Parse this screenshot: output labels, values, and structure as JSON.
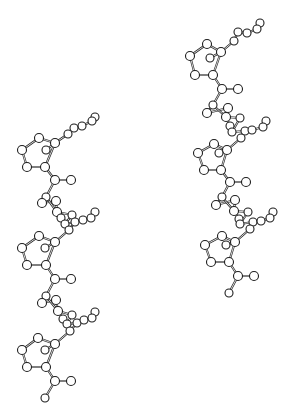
{
  "figure": {
    "width": 292,
    "height": 417,
    "background": "#ffffff",
    "ink_color": "#1e1e1e"
  },
  "molecules": [
    {
      "name": "left-chain",
      "atoms": [
        {
          "id": "L1",
          "x": 95,
          "y": 117,
          "r": 4
        },
        {
          "id": "L2",
          "x": 92,
          "y": 121,
          "r": 4
        },
        {
          "id": "L3",
          "x": 82,
          "y": 126,
          "r": 4
        },
        {
          "id": "L4",
          "x": 74,
          "y": 128,
          "r": 4
        },
        {
          "id": "L5",
          "x": 68,
          "y": 134,
          "r": 4
        },
        {
          "id": "L6",
          "x": 55,
          "y": 143,
          "r": 4.5
        },
        {
          "id": "L7",
          "x": 39,
          "y": 138,
          "r": 4.5
        },
        {
          "id": "L8",
          "x": 22,
          "y": 150,
          "r": 4.5
        },
        {
          "id": "L9",
          "x": 27,
          "y": 167,
          "r": 4.5
        },
        {
          "id": "L10",
          "x": 45,
          "y": 167,
          "r": 4.5
        },
        {
          "id": "L11",
          "x": 46,
          "y": 150,
          "r": 4
        },
        {
          "id": "L12",
          "x": 55,
          "y": 180,
          "r": 4.5
        },
        {
          "id": "L13",
          "x": 71,
          "y": 180,
          "r": 4.5
        },
        {
          "id": "L14",
          "x": 46,
          "y": 197,
          "r": 4
        },
        {
          "id": "L15",
          "x": 42,
          "y": 203,
          "r": 4.5
        },
        {
          "id": "L16",
          "x": 56,
          "y": 201,
          "r": 4.5
        },
        {
          "id": "L17",
          "x": 57,
          "y": 212,
          "r": 4.5
        },
        {
          "id": "L18",
          "x": 61,
          "y": 218,
          "r": 4
        },
        {
          "id": "L19",
          "x": 72,
          "y": 215,
          "r": 4
        },
        {
          "id": "L20",
          "x": 65,
          "y": 224,
          "r": 4
        },
        {
          "id": "L21",
          "x": 75,
          "y": 222,
          "r": 4
        },
        {
          "id": "L22",
          "x": 83,
          "y": 220,
          "r": 4
        },
        {
          "id": "L23",
          "x": 95,
          "y": 212,
          "r": 4
        },
        {
          "id": "L24",
          "x": 91,
          "y": 218,
          "r": 4
        },
        {
          "id": "L25",
          "x": 69,
          "y": 230,
          "r": 4
        },
        {
          "id": "L26",
          "x": 55,
          "y": 242,
          "r": 4.5
        },
        {
          "id": "L27",
          "x": 39,
          "y": 236,
          "r": 4.5
        },
        {
          "id": "L28",
          "x": 22,
          "y": 248,
          "r": 4.5
        },
        {
          "id": "L29",
          "x": 27,
          "y": 265,
          "r": 4.5
        },
        {
          "id": "L30",
          "x": 46,
          "y": 265,
          "r": 4.5
        },
        {
          "id": "L31",
          "x": 45,
          "y": 248,
          "r": 4
        },
        {
          "id": "L32",
          "x": 55,
          "y": 279,
          "r": 4.5
        },
        {
          "id": "L33",
          "x": 71,
          "y": 279,
          "r": 4.5
        },
        {
          "id": "L34",
          "x": 46,
          "y": 296,
          "r": 4
        },
        {
          "id": "L35",
          "x": 42,
          "y": 303,
          "r": 4.5
        },
        {
          "id": "L36",
          "x": 56,
          "y": 300,
          "r": 4.5
        },
        {
          "id": "L37",
          "x": 58,
          "y": 311,
          "r": 4.5
        },
        {
          "id": "L38",
          "x": 63,
          "y": 319,
          "r": 4
        },
        {
          "id": "L39",
          "x": 72,
          "y": 315,
          "r": 4
        },
        {
          "id": "L40",
          "x": 67,
          "y": 324,
          "r": 4
        },
        {
          "id": "L41",
          "x": 77,
          "y": 323,
          "r": 4
        },
        {
          "id": "L42",
          "x": 84,
          "y": 320,
          "r": 4
        },
        {
          "id": "L43",
          "x": 95,
          "y": 312,
          "r": 4
        },
        {
          "id": "L44",
          "x": 92,
          "y": 318,
          "r": 4
        },
        {
          "id": "L45",
          "x": 70,
          "y": 331,
          "r": 4
        },
        {
          "id": "L46",
          "x": 55,
          "y": 344,
          "r": 4.5
        },
        {
          "id": "L47",
          "x": 38,
          "y": 338,
          "r": 4.5
        },
        {
          "id": "L48",
          "x": 22,
          "y": 350,
          "r": 4.5
        },
        {
          "id": "L49",
          "x": 27,
          "y": 367,
          "r": 4.5
        },
        {
          "id": "L50",
          "x": 46,
          "y": 367,
          "r": 4.5
        },
        {
          "id": "L51",
          "x": 45,
          "y": 350,
          "r": 4
        },
        {
          "id": "L52",
          "x": 55,
          "y": 381,
          "r": 4.5
        },
        {
          "id": "L53",
          "x": 71,
          "y": 381,
          "r": 4.5
        },
        {
          "id": "L54",
          "x": 45,
          "y": 398,
          "r": 4
        }
      ],
      "bonds": [
        [
          "L1",
          "L2"
        ],
        [
          "L2",
          "L3"
        ],
        [
          "L3",
          "L4"
        ],
        [
          "L4",
          "L5"
        ],
        [
          "L5",
          "L6"
        ],
        [
          "L6",
          "L7"
        ],
        [
          "L7",
          "L8"
        ],
        [
          "L8",
          "L9"
        ],
        [
          "L9",
          "L10"
        ],
        [
          "L10",
          "L6"
        ],
        [
          "L6",
          "L11"
        ],
        [
          "L10",
          "L12"
        ],
        [
          "L12",
          "L13"
        ],
        [
          "L12",
          "L14"
        ],
        [
          "L14",
          "L15"
        ],
        [
          "L15",
          "L16"
        ],
        [
          "L16",
          "L17"
        ],
        [
          "L17",
          "L18"
        ],
        [
          "L14",
          "L17"
        ],
        [
          "L17",
          "L19"
        ],
        [
          "L19",
          "L20"
        ],
        [
          "L20",
          "L21"
        ],
        [
          "L21",
          "L22"
        ],
        [
          "L22",
          "L24"
        ],
        [
          "L23",
          "L24"
        ],
        [
          "L21",
          "L25"
        ],
        [
          "L25",
          "L26"
        ],
        [
          "L26",
          "L27"
        ],
        [
          "L27",
          "L28"
        ],
        [
          "L28",
          "L29"
        ],
        [
          "L29",
          "L30"
        ],
        [
          "L30",
          "L26"
        ],
        [
          "L26",
          "L31"
        ],
        [
          "L30",
          "L32"
        ],
        [
          "L32",
          "L33"
        ],
        [
          "L32",
          "L34"
        ],
        [
          "L34",
          "L35"
        ],
        [
          "L35",
          "L36"
        ],
        [
          "L36",
          "L37"
        ],
        [
          "L37",
          "L38"
        ],
        [
          "L34",
          "L37"
        ],
        [
          "L37",
          "L39"
        ],
        [
          "L39",
          "L40"
        ],
        [
          "L40",
          "L41"
        ],
        [
          "L41",
          "L42"
        ],
        [
          "L42",
          "L44"
        ],
        [
          "L43",
          "L44"
        ],
        [
          "L41",
          "L45"
        ],
        [
          "L45",
          "L46"
        ],
        [
          "L46",
          "L47"
        ],
        [
          "L47",
          "L48"
        ],
        [
          "L48",
          "L49"
        ],
        [
          "L49",
          "L50"
        ],
        [
          "L50",
          "L46"
        ],
        [
          "L46",
          "L51"
        ],
        [
          "L50",
          "L52"
        ],
        [
          "L52",
          "L53"
        ],
        [
          "L52",
          "L54"
        ]
      ]
    },
    {
      "name": "right-chain",
      "atoms": [
        {
          "id": "R1",
          "x": 260,
          "y": 23,
          "r": 4
        },
        {
          "id": "R2",
          "x": 257,
          "y": 29,
          "r": 4
        },
        {
          "id": "R3",
          "x": 247,
          "y": 33,
          "r": 4
        },
        {
          "id": "R4",
          "x": 238,
          "y": 32,
          "r": 4
        },
        {
          "id": "R5",
          "x": 234,
          "y": 41,
          "r": 4
        },
        {
          "id": "R6",
          "x": 221,
          "y": 52,
          "r": 4.5
        },
        {
          "id": "R7",
          "x": 207,
          "y": 44,
          "r": 4.5
        },
        {
          "id": "R8",
          "x": 190,
          "y": 56,
          "r": 4.5
        },
        {
          "id": "R9",
          "x": 195,
          "y": 75,
          "r": 4.5
        },
        {
          "id": "R10",
          "x": 213,
          "y": 75,
          "r": 4.5
        },
        {
          "id": "R11",
          "x": 210,
          "y": 58,
          "r": 4
        },
        {
          "id": "R12",
          "x": 222,
          "y": 89,
          "r": 4.5
        },
        {
          "id": "R13",
          "x": 238,
          "y": 89,
          "r": 4.5
        },
        {
          "id": "R14",
          "x": 213,
          "y": 105,
          "r": 4
        },
        {
          "id": "R15",
          "x": 207,
          "y": 113,
          "r": 4.5
        },
        {
          "id": "R16",
          "x": 228,
          "y": 108,
          "r": 4.5
        },
        {
          "id": "R17",
          "x": 226,
          "y": 117,
          "r": 4.5
        },
        {
          "id": "R18",
          "x": 230,
          "y": 126,
          "r": 4
        },
        {
          "id": "R19",
          "x": 240,
          "y": 118,
          "r": 4
        },
        {
          "id": "R20",
          "x": 232,
          "y": 132,
          "r": 4
        },
        {
          "id": "R21",
          "x": 245,
          "y": 131,
          "r": 4
        },
        {
          "id": "R22",
          "x": 252,
          "y": 130,
          "r": 4
        },
        {
          "id": "R23",
          "x": 266,
          "y": 121,
          "r": 4
        },
        {
          "id": "R24",
          "x": 263,
          "y": 127,
          "r": 4
        },
        {
          "id": "R25",
          "x": 241,
          "y": 138,
          "r": 4
        },
        {
          "id": "R26",
          "x": 227,
          "y": 150,
          "r": 4.5
        },
        {
          "id": "R27",
          "x": 214,
          "y": 144,
          "r": 4.5
        },
        {
          "id": "R28",
          "x": 198,
          "y": 153,
          "r": 4.5
        },
        {
          "id": "R29",
          "x": 204,
          "y": 170,
          "r": 4.5
        },
        {
          "id": "R30",
          "x": 221,
          "y": 170,
          "r": 4.5
        },
        {
          "id": "R31",
          "x": 219,
          "y": 153,
          "r": 4
        },
        {
          "id": "R32",
          "x": 230,
          "y": 182,
          "r": 4.5
        },
        {
          "id": "R33",
          "x": 246,
          "y": 182,
          "r": 4.5
        },
        {
          "id": "R34",
          "x": 222,
          "y": 197,
          "r": 4
        },
        {
          "id": "R35",
          "x": 216,
          "y": 205,
          "r": 4.5
        },
        {
          "id": "R36",
          "x": 235,
          "y": 200,
          "r": 4.5
        },
        {
          "id": "R37",
          "x": 234,
          "y": 211,
          "r": 4.5
        },
        {
          "id": "R38",
          "x": 239,
          "y": 219,
          "r": 4
        },
        {
          "id": "R39",
          "x": 248,
          "y": 212,
          "r": 4
        },
        {
          "id": "R40",
          "x": 240,
          "y": 224,
          "r": 4
        },
        {
          "id": "R41",
          "x": 253,
          "y": 222,
          "r": 4
        },
        {
          "id": "R42",
          "x": 261,
          "y": 221,
          "r": 4
        },
        {
          "id": "R43",
          "x": 273,
          "y": 212,
          "r": 4
        },
        {
          "id": "R44",
          "x": 270,
          "y": 218,
          "r": 4
        },
        {
          "id": "R45",
          "x": 250,
          "y": 229,
          "r": 4
        },
        {
          "id": "R46",
          "x": 235,
          "y": 242,
          "r": 4.5
        },
        {
          "id": "R47",
          "x": 222,
          "y": 236,
          "r": 4.5
        },
        {
          "id": "R48",
          "x": 205,
          "y": 245,
          "r": 4.5
        },
        {
          "id": "R49",
          "x": 211,
          "y": 262,
          "r": 4.5
        },
        {
          "id": "R50",
          "x": 229,
          "y": 262,
          "r": 4.5
        },
        {
          "id": "R51",
          "x": 226,
          "y": 245,
          "r": 4
        },
        {
          "id": "R52",
          "x": 238,
          "y": 276,
          "r": 4.5
        },
        {
          "id": "R53",
          "x": 254,
          "y": 276,
          "r": 4.5
        },
        {
          "id": "R54",
          "x": 229,
          "y": 293,
          "r": 4
        }
      ],
      "bonds": [
        [
          "R1",
          "R2"
        ],
        [
          "R2",
          "R3"
        ],
        [
          "R3",
          "R4"
        ],
        [
          "R4",
          "R5"
        ],
        [
          "R5",
          "R6"
        ],
        [
          "R6",
          "R7"
        ],
        [
          "R7",
          "R8"
        ],
        [
          "R8",
          "R9"
        ],
        [
          "R9",
          "R10"
        ],
        [
          "R10",
          "R6"
        ],
        [
          "R6",
          "R11"
        ],
        [
          "R10",
          "R12"
        ],
        [
          "R12",
          "R13"
        ],
        [
          "R12",
          "R14"
        ],
        [
          "R14",
          "R15"
        ],
        [
          "R15",
          "R16"
        ],
        [
          "R16",
          "R17"
        ],
        [
          "R17",
          "R18"
        ],
        [
          "R14",
          "R17"
        ],
        [
          "R17",
          "R19"
        ],
        [
          "R19",
          "R20"
        ],
        [
          "R20",
          "R21"
        ],
        [
          "R21",
          "R22"
        ],
        [
          "R22",
          "R24"
        ],
        [
          "R23",
          "R24"
        ],
        [
          "R21",
          "R25"
        ],
        [
          "R25",
          "R26"
        ],
        [
          "R26",
          "R27"
        ],
        [
          "R27",
          "R28"
        ],
        [
          "R28",
          "R29"
        ],
        [
          "R29",
          "R30"
        ],
        [
          "R30",
          "R26"
        ],
        [
          "R26",
          "R31"
        ],
        [
          "R30",
          "R32"
        ],
        [
          "R32",
          "R33"
        ],
        [
          "R32",
          "R34"
        ],
        [
          "R34",
          "R35"
        ],
        [
          "R35",
          "R36"
        ],
        [
          "R36",
          "R37"
        ],
        [
          "R37",
          "R38"
        ],
        [
          "R34",
          "R37"
        ],
        [
          "R37",
          "R39"
        ],
        [
          "R39",
          "R40"
        ],
        [
          "R40",
          "R41"
        ],
        [
          "R41",
          "R42"
        ],
        [
          "R42",
          "R44"
        ],
        [
          "R43",
          "R44"
        ],
        [
          "R41",
          "R45"
        ],
        [
          "R45",
          "R46"
        ],
        [
          "R46",
          "R47"
        ],
        [
          "R47",
          "R48"
        ],
        [
          "R48",
          "R49"
        ],
        [
          "R49",
          "R50"
        ],
        [
          "R50",
          "R46"
        ],
        [
          "R46",
          "R51"
        ],
        [
          "R50",
          "R52"
        ],
        [
          "R52",
          "R53"
        ],
        [
          "R52",
          "R54"
        ]
      ]
    }
  ]
}
